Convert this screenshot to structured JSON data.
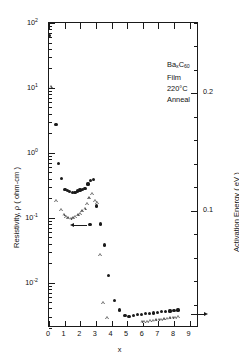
{
  "chart_data": {
    "type": "scatter",
    "title": "",
    "annotation_lines": [
      "Ba_xC_60 Film",
      "220°C Anneal"
    ],
    "annotation": {
      "material_prefix": "Ba",
      "material_sub1": "x",
      "material_mid": "C",
      "material_sub2": "60",
      "material_suffix": " Film",
      "anneal": "220°C Anneal"
    },
    "xlabel": "x",
    "ylabel": "Resistivity, ρ ( ohm-cm )",
    "y2label": "Activation Energy ( eV )",
    "xlim": [
      0,
      9.6
    ],
    "xticks": [
      0,
      1,
      2,
      3,
      4,
      5,
      6,
      7,
      8,
      9
    ],
    "xticklabels": [
      "0",
      "1",
      "2",
      "3",
      "4",
      "5",
      "6",
      "7",
      "8",
      "9"
    ],
    "yscale": "log",
    "ylim": [
      0.002,
      100
    ],
    "yticks": [
      0.01,
      0.1,
      1,
      10,
      100
    ],
    "yticklabels": [
      "10",
      "10",
      "10",
      "10",
      "10"
    ],
    "ytickexponents": [
      "-2",
      "-1",
      "0",
      "1",
      "2"
    ],
    "y2lim": [
      0.0,
      0.26
    ],
    "y2ticks": [
      0.1,
      0.2
    ],
    "y2ticklabels": [
      "0.1",
      "0.2"
    ],
    "grid": false,
    "legend": null,
    "series": [
      {
        "name": "Resistivity",
        "marker": "filled-circle",
        "axis": "left",
        "points": [
          [
            0.03,
            65.0
          ],
          [
            0.45,
            2.7
          ],
          [
            0.62,
            0.68
          ],
          [
            0.78,
            0.4
          ],
          [
            1.02,
            0.275
          ],
          [
            1.18,
            0.262
          ],
          [
            1.33,
            0.25
          ],
          [
            1.5,
            0.245
          ],
          [
            1.66,
            0.248
          ],
          [
            1.82,
            0.258
          ],
          [
            1.98,
            0.268
          ],
          [
            2.14,
            0.272
          ],
          [
            2.3,
            0.285
          ],
          [
            2.5,
            0.33
          ],
          [
            2.66,
            0.375
          ],
          [
            2.84,
            0.385
          ],
          [
            2.62,
            0.078
          ],
          [
            3.05,
            0.152
          ],
          [
            3.3,
            0.08
          ],
          [
            3.55,
            0.038
          ],
          [
            3.82,
            0.0128
          ],
          [
            4.18,
            0.0053
          ],
          [
            4.52,
            0.0038
          ],
          [
            4.86,
            0.0031
          ],
          [
            5.12,
            0.003
          ],
          [
            5.4,
            0.0031
          ],
          [
            5.66,
            0.0032
          ],
          [
            5.92,
            0.00325
          ],
          [
            6.18,
            0.0033
          ],
          [
            6.44,
            0.00335
          ],
          [
            6.7,
            0.0034
          ],
          [
            6.96,
            0.0035
          ],
          [
            7.22,
            0.00355
          ],
          [
            7.48,
            0.0036
          ],
          [
            7.74,
            0.00365
          ],
          [
            8.0,
            0.0037
          ],
          [
            8.26,
            0.0038
          ]
        ]
      },
      {
        "name": "Activation Energy",
        "marker": "open-triangle",
        "axis": "right",
        "points": [
          [
            0.12,
            0.205
          ],
          [
            0.45,
            0.108
          ],
          [
            0.8,
            0.1
          ],
          [
            0.95,
            0.096
          ],
          [
            1.1,
            0.094
          ],
          [
            1.25,
            0.093
          ],
          [
            1.4,
            0.0925
          ],
          [
            1.55,
            0.093
          ],
          [
            1.7,
            0.094
          ],
          [
            1.85,
            0.0955
          ],
          [
            2.0,
            0.097
          ],
          [
            2.15,
            0.099
          ],
          [
            2.3,
            0.101
          ],
          [
            2.45,
            0.105
          ],
          [
            2.6,
            0.11
          ],
          [
            2.78,
            0.114
          ],
          [
            2.95,
            0.108
          ],
          [
            3.1,
            0.106
          ],
          [
            3.28,
            0.062
          ],
          [
            3.48,
            0.021
          ],
          [
            3.72,
            0.008
          ],
          [
            5.95,
            0.0045
          ],
          [
            6.12,
            0.0048
          ],
          [
            6.3,
            0.005
          ],
          [
            6.48,
            0.0053
          ],
          [
            6.66,
            0.0056
          ],
          [
            6.84,
            0.0059
          ],
          [
            7.02,
            0.0062
          ],
          [
            7.2,
            0.0065
          ],
          [
            7.38,
            0.0068
          ],
          [
            7.56,
            0.0072
          ],
          [
            7.74,
            0.0076
          ],
          [
            7.92,
            0.008
          ],
          [
            8.1,
            0.0084
          ],
          [
            8.28,
            0.0088
          ]
        ]
      }
    ],
    "annotations": [
      {
        "type": "arrow",
        "direction": "left",
        "x": 2.45,
        "y_left": 0.078,
        "note": "points to left resistivity axis"
      },
      {
        "type": "arrow",
        "direction": "right",
        "x": 9.1,
        "y_right": 0.012,
        "note": "points to right activation energy axis"
      }
    ]
  }
}
